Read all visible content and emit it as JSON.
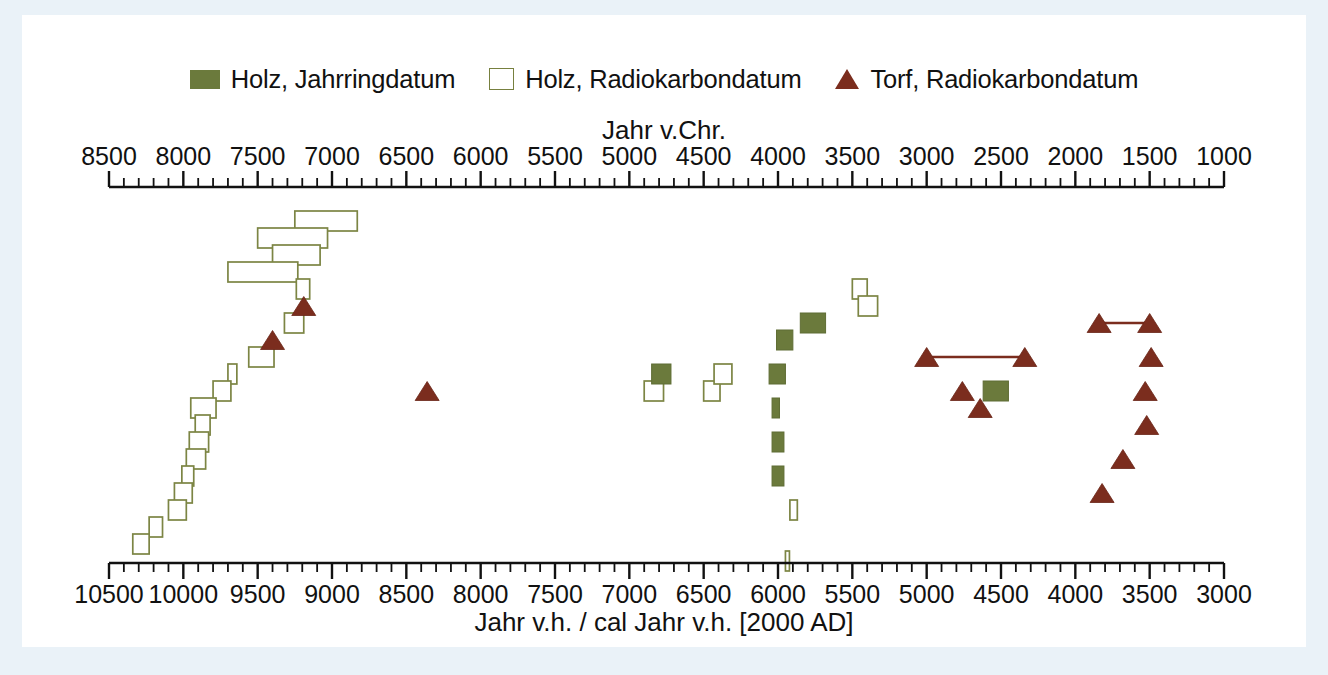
{
  "legend": {
    "items": [
      {
        "marker": "filled-square-icon",
        "label": "Holz, Jahrringdatum"
      },
      {
        "marker": "open-square-icon",
        "label": "Holz, Radiokarbondatum"
      },
      {
        "marker": "triangle-icon",
        "label": "Torf, Radiokarbondatum"
      }
    ]
  },
  "colors": {
    "wood_tree_ring": "#6b7a3c",
    "wood_radiocarbon_outline": "#7c8544",
    "peat_radiocarbon": "#7b2d1e",
    "axis": "#111111",
    "panel_background": "#ffffff",
    "page_background": "#eaf2f8"
  },
  "chart_data": {
    "type": "bar",
    "title": "",
    "subtitle": "",
    "grid": false,
    "legend_position": "top-center",
    "top_axis": {
      "label": "Jahr v.Chr.",
      "ticks": [
        8500,
        8000,
        7500,
        7000,
        6500,
        6000,
        5500,
        5000,
        4500,
        4000,
        3500,
        3000,
        2500,
        2000,
        1500,
        1000
      ],
      "range": [
        8500,
        1000
      ],
      "direction": "decreasing",
      "minor_ticks_per_interval": 5
    },
    "bottom_axis": {
      "label": "Jahr v.h. / cal Jahr v.h. [2000 AD]",
      "ticks": [
        10500,
        10000,
        9500,
        9000,
        8500,
        8000,
        7500,
        7000,
        6500,
        6000,
        5500,
        5000,
        4500,
        4000,
        3500,
        3000
      ],
      "range": [
        10500,
        3000
      ],
      "direction": "decreasing",
      "minor_ticks_per_interval": 5
    },
    "ylabel": "",
    "ylim": [
      0,
      1
    ],
    "y_axis_visible": false,
    "series": [
      {
        "name": "Holz, Jahrringdatum",
        "marker": "filled-rect",
        "color": "#6b7a3c",
        "values": [
          {
            "x_start": 6850,
            "x_end": 6720,
            "row": 10
          },
          {
            "x_start": 6010,
            "x_end": 5900,
            "row": 8
          },
          {
            "x_start": 6060,
            "x_end": 5950,
            "row": 10
          },
          {
            "x_start": 6040,
            "x_end": 5990,
            "row": 12
          },
          {
            "x_start": 6040,
            "x_end": 5960,
            "row": 14
          },
          {
            "x_start": 6040,
            "x_end": 5960,
            "row": 16
          },
          {
            "x_start": 5850,
            "x_end": 5680,
            "row": 7
          },
          {
            "x_start": 4620,
            "x_end": 4450,
            "row": 11
          }
        ]
      },
      {
        "name": "Holz, Radiokarbondatum",
        "marker": "open-rect",
        "color": "#7c8544",
        "values": [
          {
            "x_start": 9250,
            "x_end": 8830,
            "row": 1
          },
          {
            "x_start": 9500,
            "x_end": 9030,
            "row": 2
          },
          {
            "x_start": 9400,
            "x_end": 9080,
            "row": 3
          },
          {
            "x_start": 9700,
            "x_end": 9230,
            "row": 4
          },
          {
            "x_start": 9240,
            "x_end": 9150,
            "row": 5
          },
          {
            "x_start": 9320,
            "x_end": 9190,
            "row": 7
          },
          {
            "x_start": 9560,
            "x_end": 9390,
            "row": 9
          },
          {
            "x_start": 9700,
            "x_end": 9640,
            "row": 10
          },
          {
            "x_start": 9800,
            "x_end": 9680,
            "row": 11
          },
          {
            "x_start": 9950,
            "x_end": 9780,
            "row": 12
          },
          {
            "x_start": 9920,
            "x_end": 9820,
            "row": 13
          },
          {
            "x_start": 9960,
            "x_end": 9830,
            "row": 14
          },
          {
            "x_start": 9980,
            "x_end": 9850,
            "row": 15
          },
          {
            "x_start": 10010,
            "x_end": 9930,
            "row": 16
          },
          {
            "x_start": 10060,
            "x_end": 9940,
            "row": 17
          },
          {
            "x_start": 10100,
            "x_end": 9980,
            "row": 18
          },
          {
            "x_start": 10230,
            "x_end": 10140,
            "row": 19
          },
          {
            "x_start": 10340,
            "x_end": 10230,
            "row": 20
          },
          {
            "x_start": 6900,
            "x_end": 6770,
            "row": 11
          },
          {
            "x_start": 6500,
            "x_end": 6390,
            "row": 11
          },
          {
            "x_start": 6430,
            "x_end": 6310,
            "row": 10
          },
          {
            "x_start": 5500,
            "x_end": 5400,
            "row": 5
          },
          {
            "x_start": 5460,
            "x_end": 5330,
            "row": 6
          },
          {
            "x_start": 5920,
            "x_end": 5870,
            "row": 18
          },
          {
            "x_start": 5950,
            "x_end": 5930,
            "row": 21
          }
        ]
      },
      {
        "name": "Torf, Radiokarbondatum",
        "marker": "triangle",
        "color": "#7b2d1e",
        "values": [
          {
            "x": 9190,
            "row": 6
          },
          {
            "x": 9400,
            "row": 8
          },
          {
            "x": 8360,
            "row": 11
          },
          {
            "x": 4760,
            "row": 11
          },
          {
            "x": 5000,
            "row": 9,
            "link_to": 4340
          },
          {
            "x": 4340,
            "row": 9
          },
          {
            "x": 4640,
            "row": 12
          },
          {
            "x": 3840,
            "row": 7,
            "link_to": 3500
          },
          {
            "x": 3500,
            "row": 7
          },
          {
            "x": 3490,
            "row": 9
          },
          {
            "x": 3530,
            "row": 11
          },
          {
            "x": 3520,
            "row": 13
          },
          {
            "x": 3680,
            "row": 15
          },
          {
            "x": 3820,
            "row": 17
          }
        ]
      }
    ]
  }
}
